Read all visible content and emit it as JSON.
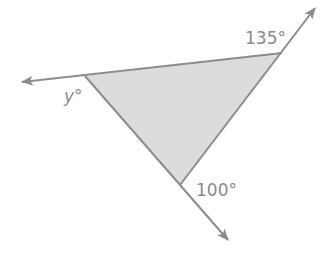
{
  "diagram": {
    "type": "triangle-exterior-angles",
    "colors": {
      "line": "#8c8c8c",
      "fill": "#dcdcdc",
      "label": "#8a8a8a",
      "background": "#ffffff"
    },
    "vertices": {
      "left": [
        85,
        76
      ],
      "top_right": [
        282,
        53
      ],
      "bottom": [
        180,
        185
      ]
    },
    "rays": [
      {
        "name": "left-ray",
        "from": [
          282,
          53
        ],
        "to": [
          22,
          82
        ]
      },
      {
        "name": "top-right-ray",
        "from": [
          180,
          185
        ],
        "to": [
          315,
          8
        ]
      },
      {
        "name": "bottom-ray",
        "from": [
          85,
          76
        ],
        "to": [
          228,
          240
        ]
      }
    ],
    "labels": {
      "top_right_angle": "135°",
      "left_angle": "y°",
      "bottom_angle": "100°"
    }
  }
}
